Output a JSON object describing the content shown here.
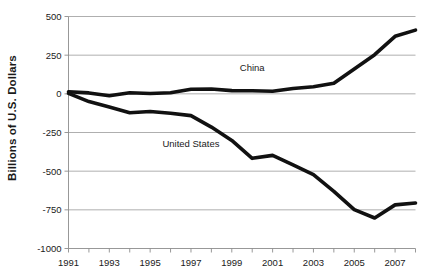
{
  "chart_data": {
    "type": "line",
    "title": "",
    "xlabel": "",
    "ylabel": "Billions of U.S. Dollars",
    "xlim": [
      1991,
      2008
    ],
    "ylim": [
      -1000,
      500
    ],
    "yticks": [
      500,
      250,
      0,
      -250,
      -500,
      -750,
      -1000
    ],
    "ytick_labels": [
      "500",
      "250",
      "0",
      "-250",
      "-500",
      "-750",
      "-1000"
    ],
    "xticks": [
      1991,
      1992,
      1993,
      1994,
      1995,
      1996,
      1997,
      1998,
      1999,
      2000,
      2001,
      2002,
      2003,
      2004,
      2005,
      2006,
      2007,
      2008
    ],
    "xtick_labels": [
      "1991",
      "",
      "1993",
      "",
      "1995",
      "",
      "1997",
      "",
      "1999",
      "",
      "2001",
      "",
      "2003",
      "",
      "2005",
      "",
      "2007",
      ""
    ],
    "grid": true,
    "legend_position": "inline-annotation",
    "x": [
      1991,
      1992,
      1993,
      1994,
      1995,
      1996,
      1997,
      1998,
      1999,
      2000,
      2001,
      2002,
      2003,
      2004,
      2005,
      2006,
      2007,
      2008
    ],
    "series": [
      {
        "name": "China",
        "color": "#111111",
        "annotation": "China",
        "annotation_x": 2000,
        "annotation_y": 150,
        "values": [
          13,
          6,
          -12,
          7,
          2,
          7,
          30,
          31,
          21,
          20,
          17,
          35,
          46,
          69,
          161,
          253,
          372,
          412
        ]
      },
      {
        "name": "United States",
        "color": "#111111",
        "annotation": "United States",
        "annotation_x": 1997,
        "annotation_y": -345,
        "values": [
          3,
          -50,
          -85,
          -122,
          -114,
          -125,
          -141,
          -215,
          -301,
          -417,
          -398,
          -459,
          -522,
          -631,
          -749,
          -803,
          -718,
          -706
        ]
      }
    ]
  },
  "axis": {
    "y_title": "Billions of U.S. Dollars"
  }
}
